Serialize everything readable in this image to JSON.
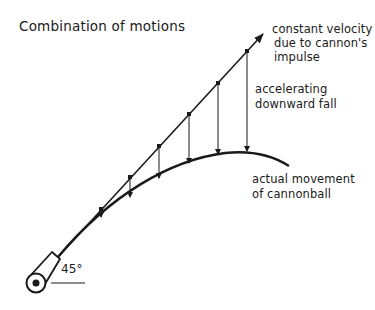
{
  "diagram": {
    "title": "Combination of motions",
    "labels": {
      "constant_velocity": [
        "constant velocity",
        "due to cannon's",
        "impulse"
      ],
      "downward_fall": [
        "accelerating",
        "downward fall"
      ],
      "actual_movement": [
        "actual movement",
        "of cannonball"
      ],
      "angle": "45°"
    },
    "geometry": {
      "launch_point": [
        58,
        257
      ],
      "straight_line_end": [
        264,
        33
      ],
      "launch_angle_deg": 45,
      "dots": [
        [
          101,
          209
        ],
        [
          130,
          177
        ],
        [
          159,
          146
        ],
        [
          189,
          114
        ],
        [
          218,
          83
        ],
        [
          247,
          51
        ]
      ],
      "curve_points": [
        [
          101,
          218
        ],
        [
          130,
          198
        ],
        [
          159,
          179
        ],
        [
          189,
          164
        ],
        [
          218,
          155
        ],
        [
          247,
          152
        ]
      ],
      "curve_end": [
        289,
        166
      ]
    },
    "colors": {
      "ink": "#1a1a1a",
      "background": "#ffffff"
    }
  }
}
